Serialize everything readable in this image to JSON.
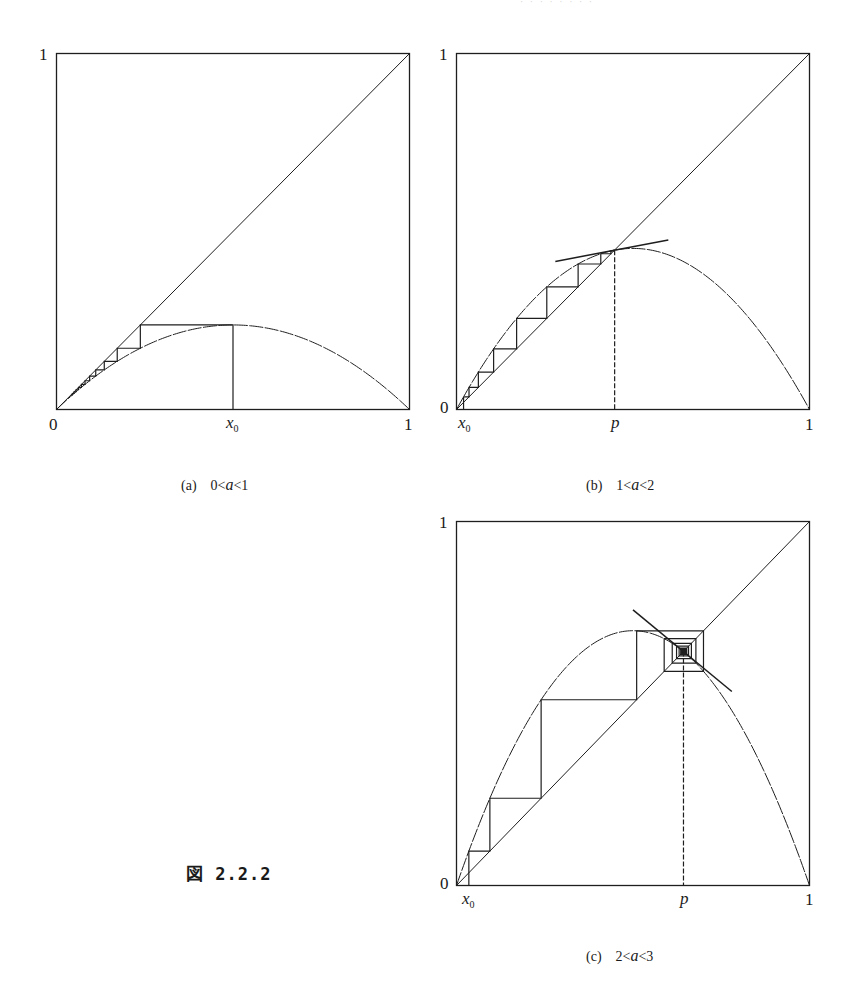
{
  "figure": {
    "label": "図 2.2.2",
    "running_head": "· · · ·  ·  ·   · ·"
  },
  "chart_data": [
    {
      "id": "a",
      "type": "line",
      "title": "Cobweb diagram of logistic map f(x) = a x (1 - x)",
      "caption_label": "(a)",
      "caption_condition": [
        "0",
        "a",
        "1"
      ],
      "a": 0.95,
      "x0": 0.5,
      "iterations": 12,
      "fixed_point": null,
      "tangent": null,
      "xlim": [
        0,
        1
      ],
      "ylim": [
        0,
        1
      ],
      "x_ticks": [
        {
          "pos": 0,
          "label": "0"
        },
        {
          "pos": 0.5,
          "label": "x0",
          "italic": true
        },
        {
          "pos": 1,
          "label": "1"
        }
      ],
      "y_ticks": [
        {
          "pos": 1,
          "label": "1"
        }
      ],
      "series": [
        {
          "name": "diagonal y = x",
          "x": [
            0,
            1
          ],
          "y": [
            0,
            1
          ]
        },
        {
          "name": "parabola y = a x (1 - x)",
          "peak": [
            0.5,
            0.2375
          ]
        },
        {
          "name": "orbit from x0",
          "start": 0.5
        }
      ],
      "grid": false,
      "legend": "none"
    },
    {
      "id": "b",
      "type": "line",
      "title": "Cobweb diagram of logistic map f(x) = a x (1 - x)",
      "caption_label": "(b)",
      "caption_condition": [
        "1",
        "a",
        "2"
      ],
      "a": 1.81,
      "x0": 0.02,
      "iterations": 30,
      "fixed_point": {
        "label": "p",
        "x": 0.448
      },
      "tangent": {
        "x_from": 0.28,
        "x_to": 0.6
      },
      "xlim": [
        0,
        1
      ],
      "ylim": [
        0,
        1
      ],
      "x_ticks": [
        {
          "pos": 0.02,
          "label": "x0",
          "italic": true
        },
        {
          "pos": 0.448,
          "label": "p",
          "italic": true
        },
        {
          "pos": 1,
          "label": "1"
        }
      ],
      "y_ticks": [
        {
          "pos": 1,
          "label": "1"
        },
        {
          "pos": 0,
          "label": "0"
        }
      ],
      "series": [
        {
          "name": "diagonal y = x",
          "x": [
            0,
            1
          ],
          "y": [
            0,
            1
          ]
        },
        {
          "name": "parabola y = a x (1 - x)",
          "peak": [
            0.5,
            0.4525
          ]
        },
        {
          "name": "orbit from x0 converging monotonically to p",
          "start": 0.02
        },
        {
          "name": "tangent at p (slope 2 - a)"
        },
        {
          "name": "dashed vertical at p"
        }
      ],
      "grid": false,
      "legend": "none"
    },
    {
      "id": "c",
      "type": "line",
      "title": "Cobweb diagram of logistic map f(x) = a x (1 - x)",
      "caption_label": "(c)",
      "caption_condition": [
        "2",
        "a",
        "3"
      ],
      "a": 2.8,
      "x0": 0.035,
      "iterations": 60,
      "fixed_point": {
        "label": "p",
        "x": 0.643
      },
      "tangent": {
        "x_from": 0.5,
        "x_to": 0.78
      },
      "xlim": [
        0,
        1
      ],
      "ylim": [
        0,
        1
      ],
      "x_ticks": [
        {
          "pos": 0.035,
          "label": "x0",
          "italic": true
        },
        {
          "pos": 0.643,
          "label": "p",
          "italic": true
        },
        {
          "pos": 1,
          "label": "1"
        }
      ],
      "y_ticks": [
        {
          "pos": 1,
          "label": "1"
        },
        {
          "pos": 0,
          "label": "0"
        }
      ],
      "series": [
        {
          "name": "diagonal y = x",
          "x": [
            0,
            1
          ],
          "y": [
            0,
            1
          ]
        },
        {
          "name": "parabola y = a x (1 - x)",
          "peak": [
            0.5,
            0.7
          ]
        },
        {
          "name": "orbit from x0 spiraling into p",
          "start": 0.035
        },
        {
          "name": "tangent at p (slope 2 - a)"
        },
        {
          "name": "dashed vertical at p"
        }
      ],
      "grid": false,
      "legend": "none"
    }
  ]
}
